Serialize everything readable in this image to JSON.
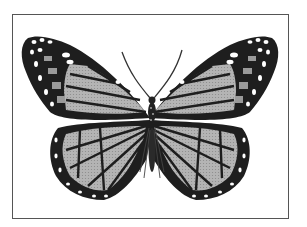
{
  "image": {
    "subject": "butterfly",
    "description": "Grayscale illustration of a monarch-type butterfly with wings spread, shown from above inside a thin rectangular frame",
    "colors": {
      "background": "#ffffff",
      "frame": "#555555",
      "wing_dark": "#222222",
      "wing_fill": "#a8a8a8",
      "wing_spots": "#ffffff"
    }
  }
}
